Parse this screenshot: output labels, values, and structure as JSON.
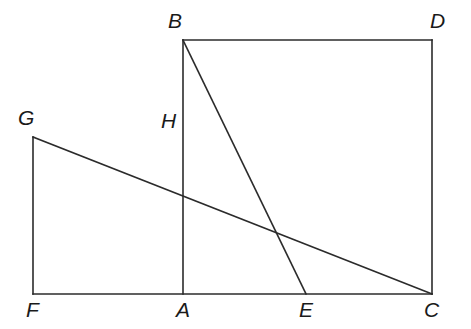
{
  "figure": {
    "canvas": {
      "width": 471,
      "height": 329
    },
    "stroke_color": "#2b2b2b",
    "label_color": "#1a1a1a",
    "background_color": "#ffffff",
    "stroke_width": 1.6,
    "points": {
      "A": {
        "x": 183,
        "y": 294
      },
      "B": {
        "x": 183,
        "y": 40
      },
      "C": {
        "x": 432,
        "y": 294
      },
      "D": {
        "x": 432,
        "y": 40
      },
      "E": {
        "x": 306,
        "y": 294
      },
      "F": {
        "x": 33,
        "y": 294
      },
      "G": {
        "x": 33,
        "y": 137
      },
      "H": {
        "x": 183,
        "y": 137
      }
    },
    "segments": [
      {
        "name": "BD-top-edge",
        "from": "B",
        "to": "D"
      },
      {
        "name": "DC-right-edge",
        "from": "D",
        "to": "C"
      },
      {
        "name": "FC-bottom-edge",
        "from": "F",
        "to": "C"
      },
      {
        "name": "GF-left-edge",
        "from": "G",
        "to": "F"
      },
      {
        "name": "GC-horizontal",
        "from": "G",
        "to": "C"
      },
      {
        "name": "BA-vertical",
        "from": "B",
        "to": "A"
      },
      {
        "name": "BE-diagonal",
        "from": "B",
        "to": "E"
      }
    ],
    "labels": [
      {
        "id": "B",
        "text": "B",
        "x": 168,
        "y": 10
      },
      {
        "id": "D",
        "text": "D",
        "x": 430,
        "y": 10
      },
      {
        "id": "G",
        "text": "G",
        "x": 18,
        "y": 107
      },
      {
        "id": "H",
        "text": "H",
        "x": 161,
        "y": 110
      },
      {
        "id": "F",
        "text": "F",
        "x": 26,
        "y": 299
      },
      {
        "id": "A",
        "text": "A",
        "x": 176,
        "y": 299
      },
      {
        "id": "E",
        "text": "E",
        "x": 299,
        "y": 299
      },
      {
        "id": "C",
        "text": "C",
        "x": 424,
        "y": 299
      }
    ]
  }
}
